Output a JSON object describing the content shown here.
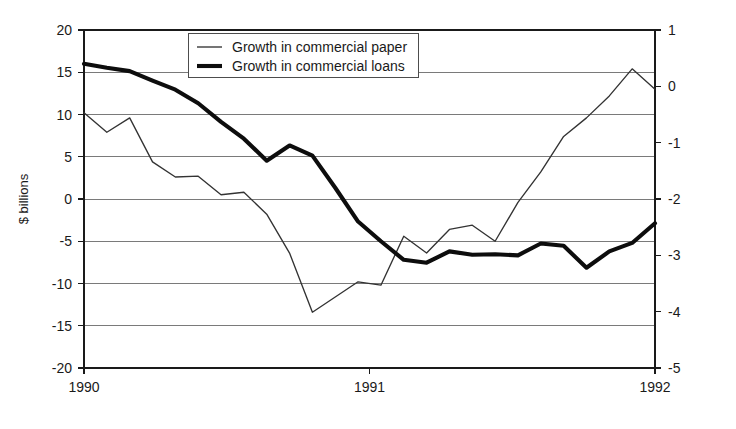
{
  "chart_data": {
    "type": "line",
    "title": "",
    "xlabel": "",
    "ylabel": "$ billions",
    "ylim": [
      -20,
      20
    ],
    "y2lim": [
      -5,
      1
    ],
    "grid": true,
    "legend_position": "top-center",
    "x_tick_labels": [
      "1990",
      "1991",
      "1992"
    ],
    "x_tick_values": [
      0,
      12,
      24
    ],
    "y_tick_labels": [
      "20",
      "15",
      "10",
      "5",
      "0",
      "-5",
      "-10",
      "-15",
      "-20"
    ],
    "y_tick_values": [
      20,
      15,
      10,
      5,
      0,
      -5,
      -10,
      -15,
      -20
    ],
    "y2_tick_labels": [
      "1",
      "0",
      "-1",
      "-2",
      "-3",
      "-4",
      "-5"
    ],
    "y2_tick_values": [
      1,
      0,
      -1,
      -2,
      -3,
      -4,
      -5
    ],
    "x": [
      0,
      1,
      2,
      3,
      4,
      5,
      6,
      7,
      8,
      9,
      10,
      11,
      12,
      13,
      14,
      15,
      16,
      17,
      18,
      19,
      20,
      21,
      22,
      23,
      24,
      25
    ],
    "series": [
      {
        "name": "Growth in commercial paper",
        "axis": "left",
        "style": "thin",
        "values": [
          10.2,
          7.9,
          9.6,
          4.4,
          2.6,
          2.7,
          0.5,
          0.8,
          -1.8,
          -6.4,
          -13.4,
          -11.6,
          -9.8,
          -10.2,
          -4.4,
          -6.4,
          -3.6,
          -3.1,
          -5.0,
          -0.4,
          3.2,
          7.4,
          9.6,
          12.2,
          15.4,
          13.0
        ]
      },
      {
        "name": "Growth in commercial loans",
        "axis": "right",
        "style": "thick",
        "values": [
          0.4,
          0.33,
          0.27,
          0.1,
          -0.06,
          -0.3,
          -0.63,
          -0.93,
          -1.32,
          -1.05,
          -1.23,
          -1.8,
          -2.4,
          -2.75,
          -3.08,
          -3.13,
          -2.93,
          -2.99,
          -2.98,
          -3.0,
          -2.79,
          -2.83,
          -3.22,
          -2.93,
          -2.78,
          -2.43
        ]
      }
    ],
    "series_left_values_note": "",
    "colors": {
      "series_thin": "#333333",
      "series_thick": "#0d0d0d",
      "gridline": "#7a7a7a",
      "axis": "#1a1a1a",
      "background": "#ffffff"
    }
  },
  "legend": {
    "entries": [
      {
        "label": "Growth in commercial paper",
        "marker": "thin-line-marker"
      },
      {
        "label": "Growth in commercial loans",
        "marker": "thick-line-marker"
      }
    ]
  },
  "axes": {
    "left_title": "$ billions"
  }
}
